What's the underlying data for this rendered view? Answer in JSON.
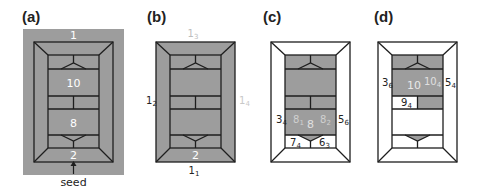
{
  "figure": {
    "panels": [
      {
        "id": "a",
        "label": "(a)",
        "background": "grey",
        "regions": {
          "outer_frame": "1",
          "top_cap": "",
          "block_upper": "10",
          "block_lower": "8",
          "bottom_cap": "2"
        },
        "annotation": {
          "text": "seed",
          "arrow": "up"
        }
      },
      {
        "id": "b",
        "label": "(b)",
        "background": "white",
        "edge_labels": {
          "top": {
            "base": "1",
            "sub": "3"
          },
          "left": {
            "base": "1",
            "sub": "2"
          },
          "right": {
            "base": "1",
            "sub": "4"
          },
          "bottom": {
            "base": "1",
            "sub": "1"
          }
        },
        "regions": {
          "bottom_cap": "2"
        }
      },
      {
        "id": "c",
        "label": "(c)",
        "background": "white",
        "regions": {
          "block_lower": "8",
          "block_lower_left": {
            "base": "8",
            "sub": "1"
          },
          "block_lower_right": {
            "base": "8",
            "sub": "2"
          }
        },
        "edge_labels": {
          "left": {
            "base": "3",
            "sub": "4"
          },
          "right": {
            "base": "5",
            "sub": "6"
          },
          "bottom_left": {
            "base": "7",
            "sub": "4"
          },
          "bottom_right": {
            "base": "6",
            "sub": "3"
          }
        }
      },
      {
        "id": "d",
        "label": "(d)",
        "background": "white",
        "regions": {
          "block_upper": "10",
          "block_upper_right": {
            "base": "10",
            "sub": "4"
          },
          "split_left": {
            "base": "9",
            "sub": "4"
          }
        },
        "edge_labels": {
          "left": {
            "base": "3",
            "sub": "6"
          },
          "right": {
            "base": "5",
            "sub": "4"
          }
        }
      }
    ],
    "colors": {
      "fill_grey": "#9d9d9d",
      "line": "#1e1e1e",
      "white_text": "#ffffff",
      "light_text": "#c8c8c8"
    }
  }
}
